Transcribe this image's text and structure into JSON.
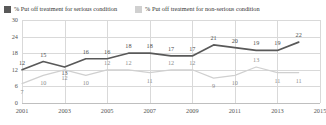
{
  "legend": {
    "entries": [
      {
        "label": "% Put off treatment for serious condition",
        "color": "#595959",
        "key": "serious"
      },
      {
        "label": "% Put off treatment for non-serious condition",
        "color": "#d0d0d0",
        "key": "nonserious"
      }
    ]
  },
  "chart_data": {
    "type": "line",
    "title": "",
    "xlabel": "",
    "ylabel": "",
    "grid": true,
    "legend_position": "top",
    "xlim": [
      2001,
      2015
    ],
    "ylim": [
      0,
      30
    ],
    "ytick_labels": [
      "0",
      "6",
      "12",
      "18",
      "24",
      "30"
    ],
    "yticks": [
      0,
      6,
      12,
      18,
      24,
      30
    ],
    "xtick_labels": [
      "2001",
      "2003",
      "2005",
      "2007",
      "2009",
      "2011",
      "2013",
      "2015"
    ],
    "xticks": [
      2001,
      2003,
      2005,
      2007,
      2009,
      2011,
      2013,
      2015
    ],
    "x": [
      2001,
      2002,
      2003,
      2004,
      2005,
      2006,
      2007,
      2008,
      2009,
      2010,
      2011,
      2012,
      2013,
      2014
    ],
    "series": [
      {
        "name": "% Put off treatment for serious condition",
        "key": "serious",
        "color": "#595959",
        "values": [
          12,
          15,
          13,
          16,
          16,
          18,
          18,
          17,
          17,
          21,
          20,
          19,
          19,
          22
        ],
        "label_offsets": [
          -7,
          -7,
          6,
          -7,
          -7,
          -7,
          -7,
          -7,
          -7,
          -7,
          -7,
          -7,
          -7,
          -7
        ]
      },
      {
        "name": "% Put off treatment for non-serious condition",
        "key": "nonserious",
        "color": "#d0d0d0",
        "values": [
          7,
          10,
          12,
          10,
          12,
          12,
          11,
          12,
          12,
          9,
          10,
          13,
          11,
          11
        ],
        "label_offsets": [
          8,
          8,
          8,
          8,
          -7,
          -7,
          8,
          -7,
          -7,
          8,
          8,
          -7,
          8,
          8
        ]
      }
    ]
  }
}
